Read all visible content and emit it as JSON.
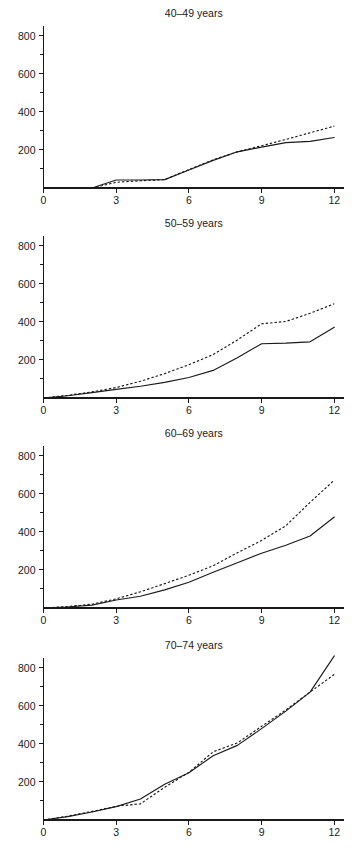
{
  "figure": {
    "xlabel": "Years after randomization",
    "background": "#ffffff",
    "ink_color": "#1a1a1a"
  },
  "chart_data": {
    "type": "line",
    "title": "",
    "subtitle": "",
    "xlabel": "Years after randomization",
    "ylabel": "",
    "xlim": [
      0,
      12.4
    ],
    "ylim": [
      0,
      830
    ],
    "xticks": [
      0,
      3,
      6,
      9,
      12
    ],
    "xtick_labels": [
      "0",
      "3",
      "6",
      "9",
      "12"
    ],
    "yticks": [
      200,
      400,
      600,
      800
    ],
    "ytick_labels": [
      "200",
      "400",
      "600",
      "800"
    ],
    "yticks_minor": [
      100,
      300,
      500,
      700
    ],
    "grid": false,
    "legend": null,
    "legend_position": "none",
    "panel_layout": "4 rows x 1 column, shared axes",
    "series_styles": [
      {
        "name": "solid",
        "dash": "solid"
      },
      {
        "name": "dashed",
        "dash": "dashed"
      }
    ],
    "panels": [
      {
        "title": "40–49 years",
        "x": [
          0,
          1,
          2,
          3,
          4,
          5,
          6,
          7,
          8,
          9,
          10,
          11,
          12
        ],
        "series": [
          {
            "name": "solid",
            "dash": "solid",
            "values": [
              0,
              0,
              0,
              42,
              42,
              44,
              95,
              145,
              190,
              215,
              238,
              245,
              265
            ]
          },
          {
            "name": "dashed",
            "dash": "dashed",
            "values": [
              0,
              0,
              0,
              30,
              38,
              44,
              97,
              148,
              190,
              222,
              255,
              290,
              325
            ]
          }
        ]
      },
      {
        "title": "50–59 years",
        "x": [
          0,
          1,
          2,
          3,
          4,
          5,
          6,
          7,
          8,
          9,
          10,
          11,
          12
        ],
        "series": [
          {
            "name": "solid",
            "dash": "solid",
            "values": [
              0,
              12,
              28,
              45,
              62,
              82,
              108,
              145,
              212,
              285,
              288,
              295,
              372
            ]
          },
          {
            "name": "dashed",
            "dash": "dashed",
            "values": [
              0,
              14,
              32,
              55,
              88,
              128,
              175,
              228,
              305,
              390,
              402,
              445,
              495
            ]
          }
        ]
      },
      {
        "title": "60–69 years",
        "x": [
          0,
          1,
          2,
          3,
          4,
          5,
          6,
          7,
          8,
          9,
          10,
          11,
          12
        ],
        "series": [
          {
            "name": "solid",
            "dash": "solid",
            "values": [
              0,
              5,
              15,
              42,
              62,
              95,
              135,
              188,
              238,
              288,
              330,
              378,
              478
            ]
          },
          {
            "name": "dashed",
            "dash": "dashed",
            "values": [
              0,
              8,
              20,
              48,
              85,
              128,
              172,
              222,
              290,
              355,
              432,
              555,
              672
            ]
          }
        ]
      },
      {
        "title": "70–74 years",
        "x": [
          0,
          1,
          2,
          3,
          4,
          5,
          6,
          7,
          8,
          9,
          10,
          11,
          12
        ],
        "series": [
          {
            "name": "solid",
            "dash": "solid",
            "values": [
              0,
              18,
              42,
              70,
              110,
              188,
              248,
              338,
              392,
              480,
              572,
              672,
              862
            ]
          },
          {
            "name": "dashed",
            "dash": "dashed",
            "values": [
              0,
              20,
              45,
              72,
              85,
              172,
              250,
              358,
              405,
              492,
              578,
              672,
              765
            ]
          }
        ]
      }
    ]
  }
}
